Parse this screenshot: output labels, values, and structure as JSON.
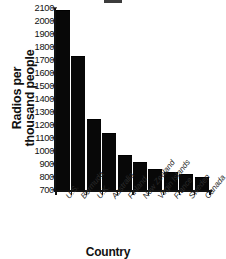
{
  "chart_data": {
    "type": "bar",
    "title": "",
    "xlabel": "Country",
    "ylabel_lines": [
      "Radios per",
      "thousand people"
    ],
    "ylabel": "Radios per thousand people",
    "categories": [
      "U.S.",
      "Bermuda",
      "U.K.",
      "Australia",
      "Finland",
      "New Zealand",
      "Virgin Islands",
      "France",
      "Sweden",
      "Canada"
    ],
    "values": [
      2080,
      1720,
      1240,
      1130,
      965,
      905,
      855,
      828,
      815,
      795
    ],
    "ylim": [
      700,
      2100
    ],
    "ytick_values": [
      700,
      800,
      900,
      1000,
      1100,
      1200,
      1300,
      1400,
      1500,
      1600,
      1700,
      1800,
      1900,
      2000,
      2100
    ],
    "ytick_labels": [
      "700",
      "800",
      "900",
      "1000",
      "1100",
      "1200",
      "1300",
      "1400",
      "1500",
      "1600",
      "1700",
      "1800",
      "1900",
      "2000",
      "2100"
    ],
    "grid": false,
    "legend": false,
    "bar_color": "#080808",
    "axis_color": "#111111"
  }
}
